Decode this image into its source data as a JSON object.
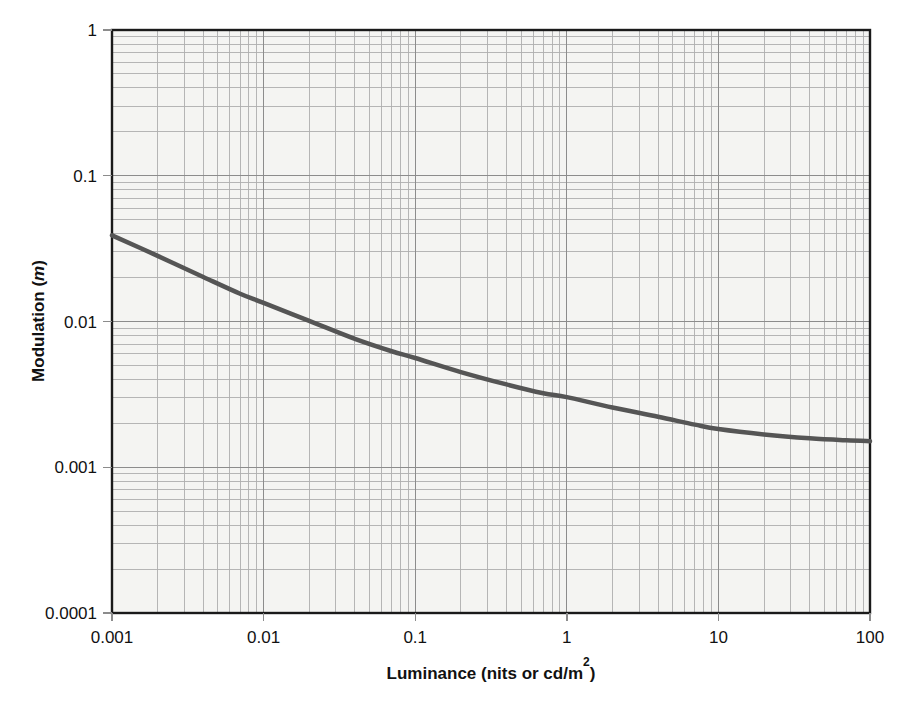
{
  "chart_data": {
    "type": "line",
    "title": "",
    "subtitle": "",
    "xlabel": "Luminance (nits or cd/m2)",
    "xlabel_parts": {
      "main": "Luminance (nits or cd/m",
      "sup": "2",
      "tail": ")"
    },
    "ylabel": "Modulation (m)",
    "ylabel_parts": {
      "main": "Modulation (",
      "italic": "m",
      "tail": ")"
    },
    "xscale": "log",
    "yscale": "log",
    "xlim": [
      0.001,
      100
    ],
    "ylim": [
      0.0001,
      1
    ],
    "grid": true,
    "grid_minor": true,
    "legend": "none",
    "xticks": [
      0.001,
      0.01,
      0.1,
      1,
      10,
      100
    ],
    "xticklabels": [
      "0.001",
      "0.01",
      "0.1",
      "1",
      "10",
      "100"
    ],
    "yticks": [
      0.0001,
      0.001,
      0.01,
      0.1,
      1
    ],
    "yticklabels": [
      "0.0001",
      "0.001",
      "0.01",
      "0.1",
      "1"
    ],
    "series": [
      {
        "name": "Threshold modulation",
        "color": "#555555",
        "linewidth": 4.5,
        "x": [
          0.001,
          0.002,
          0.004,
          0.007,
          0.01,
          0.02,
          0.04,
          0.07,
          0.1,
          0.2,
          0.4,
          0.7,
          1,
          2,
          4,
          7,
          10,
          20,
          40,
          70,
          100
        ],
        "y": [
          0.039,
          0.0282,
          0.0202,
          0.0155,
          0.0134,
          0.0101,
          0.0076,
          0.00625,
          0.00562,
          0.0045,
          0.0037,
          0.00322,
          0.00303,
          0.00257,
          0.00222,
          0.00196,
          0.00183,
          0.00168,
          0.00158,
          0.00153,
          0.00151
        ]
      }
    ]
  },
  "figure": {
    "plot_background": "#f4f4f2",
    "grid_major_color": "#8c8c8c",
    "grid_minor_color": "#aeaeae",
    "frame_color": "#1a1a1a",
    "curve_color": "#555555",
    "text_color": "#111111"
  }
}
